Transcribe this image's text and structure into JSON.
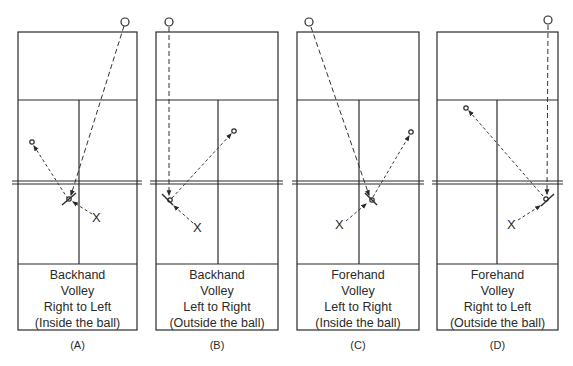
{
  "figure": {
    "type": "tennis-volley-diagrams",
    "panels": [
      {
        "id": "A",
        "label": "(A)",
        "caption": [
          "Backhand",
          "Volley",
          "Right to Left",
          "(Inside the ball)"
        ],
        "stroke": "Backhand Volley",
        "direction": "Right to Left",
        "position_note": "(Inside the ball)",
        "player_marker": "X"
      },
      {
        "id": "B",
        "label": "(B)",
        "caption": [
          "Backhand",
          "Volley",
          "Left to Right",
          "(Outside the ball)"
        ],
        "stroke": "Backhand Volley",
        "direction": "Left to Right",
        "position_note": "(Outside the ball)",
        "player_marker": "X"
      },
      {
        "id": "C",
        "label": "(C)",
        "caption": [
          "Forehand",
          "Volley",
          "Left to Right",
          "(Inside the ball)"
        ],
        "stroke": "Forehand Volley",
        "direction": "Left to Right",
        "position_note": "(Inside the ball)",
        "player_marker": "X"
      },
      {
        "id": "D",
        "label": "(D)",
        "caption": [
          "Forehand",
          "Volley",
          "Right to Left",
          "(Outside the ball)"
        ],
        "stroke": "Forehand Volley",
        "direction": "Right to Left",
        "position_note": "(Outside the ball)",
        "player_marker": "X"
      }
    ],
    "colors": {
      "line": "#2a2a2a",
      "background": "#ffffff"
    }
  }
}
